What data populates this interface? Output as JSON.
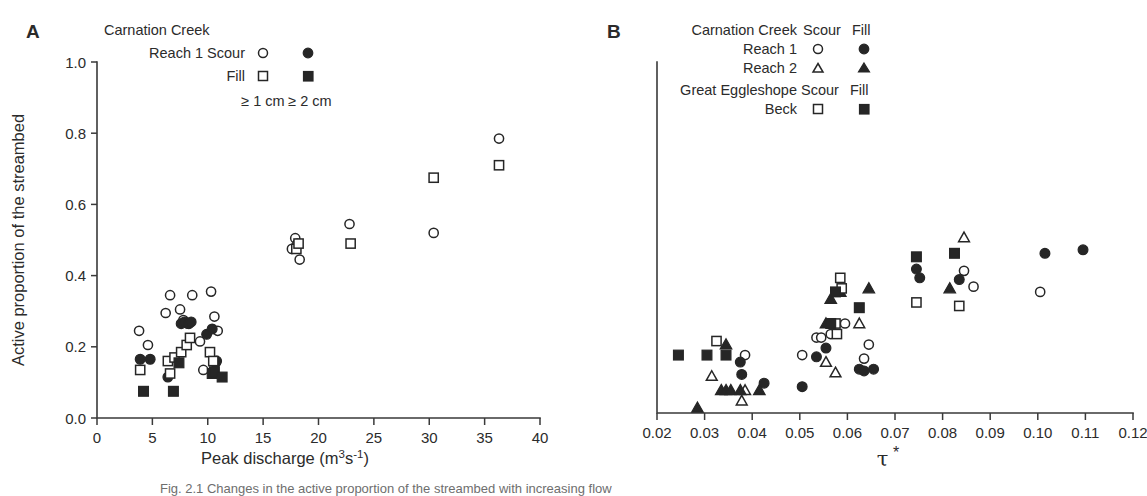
{
  "figure": {
    "caption_partial": "Fig. 2.1  Changes in the active proportion of the streambed with increasing flow",
    "panels": [
      "A",
      "B"
    ]
  },
  "panelA": {
    "letter": "A",
    "legend": {
      "title": "Carnation Creek",
      "rows": [
        {
          "label": "Reach 1 Scour",
          "marker1": "open-circle",
          "marker2": "filled-circle"
        },
        {
          "label": "Fill",
          "marker1": "open-square",
          "marker2": "filled-square"
        }
      ],
      "col1_label": "≥ 1 cm",
      "col2_label": "≥ 2 cm"
    }
  },
  "panelB": {
    "letter": "B",
    "legend": {
      "group1_title": "Carnation Creek",
      "group1_col1": "Scour",
      "group1_col2": "Fill",
      "group1_rows": [
        {
          "label": "Reach 1",
          "marker1": "open-circle",
          "marker2": "filled-circle"
        },
        {
          "label": "Reach 2",
          "marker1": "open-triangle",
          "marker2": "filled-triangle"
        }
      ],
      "group2_title": "Great Eggleshope",
      "group2_col1": "Scour",
      "group2_col2": "Fill",
      "group2_rows": [
        {
          "label": "Beck",
          "marker1": "open-square",
          "marker2": "filled-square"
        }
      ]
    }
  },
  "chart_data": [
    {
      "type": "scatter",
      "panel": "A",
      "title": "",
      "xlabel": "Peak discharge (m³s⁻¹)",
      "ylabel": "Active proportion of the streambed",
      "xlim": [
        0,
        40
      ],
      "ylim": [
        0.0,
        1.0
      ],
      "xticks": [
        0,
        5,
        10,
        15,
        20,
        25,
        30,
        35,
        40
      ],
      "xticklabels": [
        "0",
        "5",
        "10",
        "15",
        "20",
        "25",
        "30",
        "35",
        "40"
      ],
      "yticks": [
        0.0,
        0.2,
        0.4,
        0.6,
        0.8,
        1.0
      ],
      "yticklabels": [
        "0.0",
        "0.2",
        "0.4",
        "0.6",
        "0.8",
        "1.0"
      ],
      "grid": false,
      "legend_position": "top-left",
      "series": [
        {
          "name": "Reach 1 Scour ≥ 1 cm",
          "marker": "open-circle",
          "points": [
            [
              3.8,
              0.245
            ],
            [
              4.6,
              0.205
            ],
            [
              6.2,
              0.295
            ],
            [
              6.6,
              0.345
            ],
            [
              7.5,
              0.305
            ],
            [
              7.8,
              0.275
            ],
            [
              8.2,
              0.265
            ],
            [
              8.6,
              0.345
            ],
            [
              9.3,
              0.215
            ],
            [
              9.6,
              0.135
            ],
            [
              10.3,
              0.355
            ],
            [
              10.6,
              0.285
            ],
            [
              10.9,
              0.245
            ],
            [
              17.6,
              0.475
            ],
            [
              17.9,
              0.505
            ],
            [
              18.1,
              0.49
            ],
            [
              18.3,
              0.445
            ],
            [
              22.8,
              0.545
            ],
            [
              30.4,
              0.52
            ],
            [
              36.3,
              0.785
            ]
          ]
        },
        {
          "name": "Reach 1 Scour ≥ 2 cm",
          "marker": "filled-circle",
          "points": [
            [
              3.9,
              0.165
            ],
            [
              4.8,
              0.165
            ],
            [
              7.6,
              0.265
            ],
            [
              7.9,
              0.27
            ],
            [
              8.3,
              0.265
            ],
            [
              8.5,
              0.27
            ],
            [
              9.9,
              0.235
            ],
            [
              10.4,
              0.25
            ],
            [
              10.7,
              0.155
            ],
            [
              10.8,
              0.16
            ],
            [
              6.4,
              0.115
            ]
          ]
        },
        {
          "name": "Reach 1 Fill ≥ 1 cm",
          "marker": "open-square",
          "points": [
            [
              3.9,
              0.135
            ],
            [
              6.4,
              0.16
            ],
            [
              7.0,
              0.17
            ],
            [
              7.6,
              0.185
            ],
            [
              8.1,
              0.205
            ],
            [
              8.4,
              0.225
            ],
            [
              6.6,
              0.125
            ],
            [
              10.2,
              0.185
            ],
            [
              10.5,
              0.16
            ],
            [
              18.0,
              0.475
            ],
            [
              18.2,
              0.49
            ],
            [
              22.9,
              0.49
            ],
            [
              30.4,
              0.675
            ],
            [
              36.3,
              0.71
            ]
          ]
        },
        {
          "name": "Reach 1 Fill ≥ 2 cm",
          "marker": "filled-square",
          "points": [
            [
              4.2,
              0.075
            ],
            [
              6.9,
              0.075
            ],
            [
              7.4,
              0.155
            ],
            [
              10.4,
              0.125
            ],
            [
              10.6,
              0.13
            ],
            [
              11.3,
              0.115
            ]
          ]
        }
      ]
    },
    {
      "type": "scatter",
      "panel": "B",
      "title": "",
      "xlabel": "τ *",
      "ylabel": "",
      "xlim": [
        0.02,
        0.12
      ],
      "ylim": [
        0.0,
        1.0
      ],
      "xticks": [
        0.02,
        0.03,
        0.04,
        0.05,
        0.06,
        0.07,
        0.08,
        0.09,
        0.1,
        0.11,
        0.12
      ],
      "xticklabels": [
        "0.02",
        "0.03",
        "0.04",
        "0.05",
        "0.06",
        "0.07",
        "0.08",
        "0.09",
        "0.10",
        "0.11",
        "0.12"
      ],
      "yticks": [
        0.0,
        0.2,
        0.4,
        0.6,
        0.8,
        1.0
      ],
      "grid": false,
      "legend_position": "top-left",
      "series": [
        {
          "name": "Carnation Creek Reach 1 Scour",
          "marker": "open-circle",
          "points": [
            [
              0.0385,
              0.165
            ],
            [
              0.0505,
              0.165
            ],
            [
              0.0535,
              0.215
            ],
            [
              0.0545,
              0.215
            ],
            [
              0.0565,
              0.225
            ],
            [
              0.0595,
              0.255
            ],
            [
              0.0635,
              0.155
            ],
            [
              0.0645,
              0.195
            ],
            [
              0.0845,
              0.405
            ],
            [
              0.0865,
              0.36
            ],
            [
              0.1005,
              0.345
            ]
          ]
        },
        {
          "name": "Carnation Creek Reach 1 Fill",
          "marker": "filled-circle",
          "points": [
            [
              0.0375,
              0.145
            ],
            [
              0.0378,
              0.11
            ],
            [
              0.0425,
              0.085
            ],
            [
              0.0505,
              0.075
            ],
            [
              0.0535,
              0.16
            ],
            [
              0.0555,
              0.185
            ],
            [
              0.0625,
              0.125
            ],
            [
              0.0635,
              0.12
            ],
            [
              0.0655,
              0.125
            ],
            [
              0.0745,
              0.41
            ],
            [
              0.0752,
              0.385
            ],
            [
              0.0835,
              0.38
            ],
            [
              0.1015,
              0.455
            ],
            [
              0.1095,
              0.465
            ]
          ]
        },
        {
          "name": "Carnation Creek Reach 2 Scour",
          "marker": "open-triangle",
          "points": [
            [
              0.0315,
              0.105
            ],
            [
              0.0378,
              0.035
            ],
            [
              0.0385,
              0.065
            ],
            [
              0.0555,
              0.145
            ],
            [
              0.0575,
              0.115
            ],
            [
              0.0625,
              0.255
            ],
            [
              0.0845,
              0.5
            ]
          ]
        },
        {
          "name": "Carnation Creek Reach 2 Fill",
          "marker": "filled-triangle",
          "points": [
            [
              0.0285,
              0.015
            ],
            [
              0.0335,
              0.065
            ],
            [
              0.0345,
              0.065
            ],
            [
              0.0355,
              0.065
            ],
            [
              0.0375,
              0.065
            ],
            [
              0.0345,
              0.195
            ],
            [
              0.0415,
              0.065
            ],
            [
              0.0555,
              0.255
            ],
            [
              0.0565,
              0.325
            ],
            [
              0.0585,
              0.345
            ],
            [
              0.0645,
              0.355
            ],
            [
              0.0815,
              0.355
            ]
          ]
        },
        {
          "name": "Great Eggleshope Beck Scour",
          "marker": "open-square",
          "points": [
            [
              0.0325,
              0.205
            ],
            [
              0.0575,
              0.255
            ],
            [
              0.0578,
              0.225
            ],
            [
              0.0585,
              0.385
            ],
            [
              0.0588,
              0.355
            ],
            [
              0.0745,
              0.315
            ],
            [
              0.0835,
              0.305
            ]
          ]
        },
        {
          "name": "Great Eggleshope Beck Fill",
          "marker": "filled-square",
          "points": [
            [
              0.0245,
              0.165
            ],
            [
              0.0305,
              0.165
            ],
            [
              0.0345,
              0.165
            ],
            [
              0.0565,
              0.255
            ],
            [
              0.0575,
              0.345
            ],
            [
              0.0625,
              0.3
            ],
            [
              0.0745,
              0.445
            ],
            [
              0.0825,
              0.455
            ]
          ]
        }
      ]
    }
  ]
}
